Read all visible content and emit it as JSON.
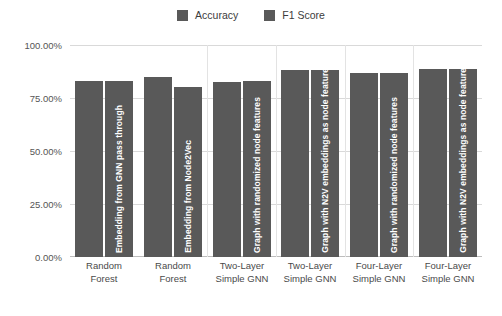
{
  "chart_data": {
    "type": "bar",
    "title": "",
    "subtitle": "",
    "xlabel": "",
    "ylabel": "",
    "ylim": [
      0,
      100
    ],
    "grid": true,
    "legend_position": "top-center",
    "y_ticks": [
      "0.00%",
      "25.00%",
      "50.00%",
      "75.00%",
      "100.00%"
    ],
    "y_tick_values": [
      0,
      25,
      50,
      75,
      100
    ],
    "categories": [
      "Random Forest",
      "Random Forest",
      "Two-Layer Simple GNN",
      "Two-Layer Simple GNN",
      "Four-Layer Simple GNN",
      "Four-Layer Simple GNN"
    ],
    "category_lines": [
      [
        "Random",
        "Forest"
      ],
      [
        "Random",
        "Forest"
      ],
      [
        "Two-Layer",
        "Simple GNN"
      ],
      [
        "Two-Layer",
        "Simple GNN"
      ],
      [
        "Four-Layer",
        "Simple GNN"
      ],
      [
        "Four-Layer",
        "Simple GNN"
      ]
    ],
    "bar_annotations": [
      "Embedding from GNN pass through",
      "Embedding from Node2Vec",
      "Graph with randomized node features",
      "Graph with N2V embeddings as node features",
      "Graph with randomized node features",
      "Graph with N2V embeddings as node features"
    ],
    "series": [
      {
        "name": "Accuracy",
        "color": "#595959",
        "values": [
          83.0,
          84.8,
          82.7,
          88.2,
          86.8,
          88.6
        ]
      },
      {
        "name": "F1 Score",
        "color": "#595959",
        "values": [
          83.0,
          80.3,
          82.8,
          88.3,
          86.9,
          88.9
        ]
      }
    ]
  },
  "legend": {
    "items": [
      {
        "label": "Accuracy",
        "color": "#595959"
      },
      {
        "label": "F1 Score",
        "color": "#595959"
      }
    ]
  },
  "colors": {
    "bar": "#595959",
    "gridline": "#d9d9d9",
    "axis": "#bdbdbd",
    "tick_text": "#555555",
    "label_text": "#4a4a4a",
    "bar_text": "#ffffff",
    "background": "#ffffff"
  }
}
